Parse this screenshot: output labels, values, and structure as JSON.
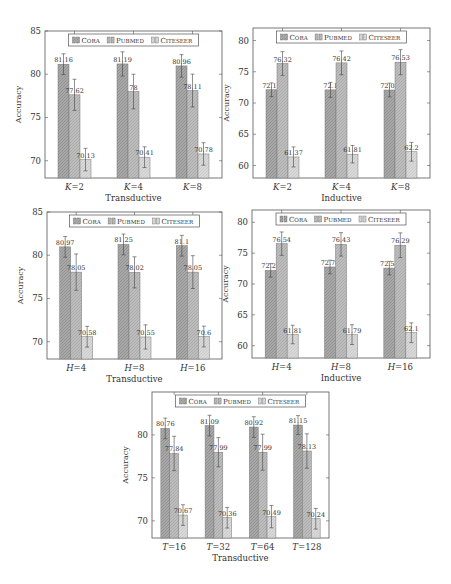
{
  "legend": [
    "Cora",
    "Pubmed",
    "Citeseer"
  ],
  "colors": {
    "Cora": "#a8a8a8",
    "Pubmed": "#bdbdbd",
    "Citeseer": "#d9d9d9",
    "frame": "#555555"
  },
  "chart_data": [
    {
      "id": "k-transductive",
      "type": "bar",
      "title": "",
      "xlabel": "Transductive",
      "ylabel": "Accuracy",
      "ylim": [
        68,
        85
      ],
      "yticks": [
        70,
        75,
        80,
        85
      ],
      "categories": [
        "K=2",
        "K=4",
        "K=8"
      ],
      "category_labels": [
        {
          "var": "K",
          "val": "2"
        },
        {
          "var": "K",
          "val": "4"
        },
        {
          "var": "K",
          "val": "8"
        }
      ],
      "series": [
        {
          "name": "Cora",
          "values": [
            81.16,
            81.19,
            80.96
          ],
          "err": [
            1.2,
            1.4,
            1.3
          ]
        },
        {
          "name": "Pubmed",
          "values": [
            77.62,
            78,
            78.11
          ],
          "err": [
            1.8,
            2.0,
            1.9
          ]
        },
        {
          "name": "Citeseer",
          "values": [
            70.13,
            70.41,
            70.78
          ],
          "err": [
            1.3,
            1.2,
            1.3
          ]
        }
      ],
      "legend_position": "top",
      "grid": false
    },
    {
      "id": "k-inductive",
      "type": "bar",
      "title": "",
      "xlabel": "Inductive",
      "ylabel": "Accuracy",
      "ylim": [
        58,
        82
      ],
      "yticks": [
        60,
        65,
        70,
        75,
        80
      ],
      "categories": [
        "K=2",
        "K=4",
        "K=8"
      ],
      "category_labels": [
        {
          "var": "K",
          "val": "2"
        },
        {
          "var": "K",
          "val": "4"
        },
        {
          "var": "K",
          "val": "8"
        }
      ],
      "series": [
        {
          "name": "Cora",
          "values": [
            72.12,
            72.1,
            72.08
          ],
          "err": [
            1.1,
            1.2,
            1.1
          ]
        },
        {
          "name": "Pubmed",
          "values": [
            76.32,
            76.42,
            76.53
          ],
          "err": [
            1.9,
            1.9,
            2.0
          ]
        },
        {
          "name": "Citeseer",
          "values": [
            61.37,
            61.81,
            62.2
          ],
          "err": [
            1.6,
            1.4,
            1.5
          ]
        }
      ],
      "legend_position": "top",
      "grid": false
    },
    {
      "id": "h-transductive",
      "type": "bar",
      "title": "",
      "xlabel": "Transductive",
      "ylabel": "Accuracy",
      "ylim": [
        68,
        85
      ],
      "yticks": [
        70,
        75,
        80,
        85
      ],
      "categories": [
        "H=4",
        "H=8",
        "H=16"
      ],
      "category_labels": [
        {
          "var": "H",
          "val": "4"
        },
        {
          "var": "H",
          "val": "8"
        },
        {
          "var": "H",
          "val": "16"
        }
      ],
      "series": [
        {
          "name": "Cora",
          "values": [
            80.97,
            81.25,
            81.1
          ],
          "err": [
            1.2,
            1.2,
            1.2
          ]
        },
        {
          "name": "Pubmed",
          "values": [
            78.05,
            78.02,
            78.05
          ],
          "err": [
            2.1,
            1.8,
            1.9
          ]
        },
        {
          "name": "Citeseer",
          "values": [
            70.58,
            70.55,
            70.6
          ],
          "err": [
            1.2,
            1.4,
            1.2
          ]
        }
      ],
      "legend_position": "top",
      "grid": false
    },
    {
      "id": "h-inductive",
      "type": "bar",
      "title": "",
      "xlabel": "Inductive",
      "ylabel": "Accuracy",
      "ylim": [
        58,
        82
      ],
      "yticks": [
        60,
        65,
        70,
        75,
        80
      ],
      "categories": [
        "H=4",
        "H=8",
        "H=16"
      ],
      "category_labels": [
        {
          "var": "H",
          "val": "4"
        },
        {
          "var": "H",
          "val": "8"
        },
        {
          "var": "H",
          "val": "16"
        }
      ],
      "series": [
        {
          "name": "Cora",
          "values": [
            72.21,
            72.76,
            72.58
          ],
          "err": [
            1.1,
            1.1,
            1.1
          ]
        },
        {
          "name": "Pubmed",
          "values": [
            76.54,
            76.43,
            76.29
          ],
          "err": [
            1.9,
            1.9,
            2.0
          ]
        },
        {
          "name": "Citeseer",
          "values": [
            61.81,
            61.79,
            62.1
          ],
          "err": [
            1.5,
            1.6,
            1.6
          ]
        }
      ],
      "legend_position": "top",
      "grid": false
    },
    {
      "id": "t-transductive",
      "type": "bar",
      "title": "",
      "xlabel": "Transductive",
      "ylabel": "Accuracy",
      "ylim": [
        68,
        85
      ],
      "yticks": [
        70,
        75,
        80
      ],
      "categories": [
        "T=16",
        "T=32",
        "T=64",
        "T=128"
      ],
      "category_labels": [
        {
          "var": "T",
          "val": "16"
        },
        {
          "var": "T",
          "val": "32"
        },
        {
          "var": "T",
          "val": "64"
        },
        {
          "var": "T",
          "val": "128"
        }
      ],
      "series": [
        {
          "name": "Cora",
          "values": [
            80.76,
            81.09,
            80.92,
            81.15
          ],
          "err": [
            1.2,
            1.2,
            1.2,
            1.1
          ]
        },
        {
          "name": "Pubmed",
          "values": [
            77.84,
            77.99,
            77.99,
            78.13
          ],
          "err": [
            2.0,
            1.7,
            2.1,
            2.0
          ]
        },
        {
          "name": "Citeseer",
          "values": [
            70.67,
            70.36,
            70.49,
            70.24
          ],
          "err": [
            1.2,
            1.2,
            1.3,
            1.2
          ]
        }
      ],
      "legend_position": "top",
      "grid": false
    }
  ]
}
